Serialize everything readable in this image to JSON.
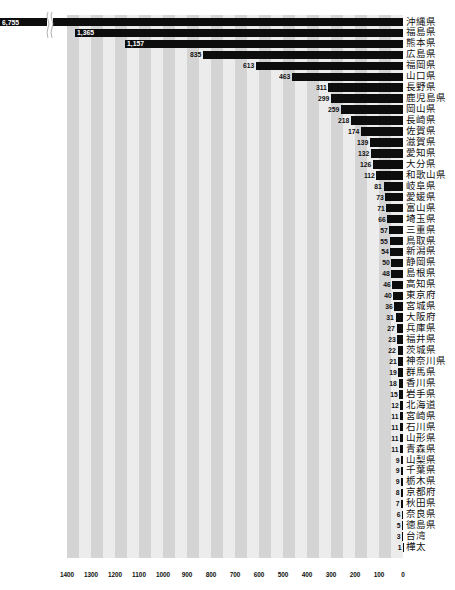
{
  "chart_data": {
    "type": "bar",
    "orientation": "horizontal",
    "direction": "right-to-left",
    "title": "",
    "xlabel": "",
    "ylabel": "",
    "xlim": [
      0,
      1400
    ],
    "axis_break_on_first_bar": true,
    "grid": "alternating vertical stripes every 50",
    "x_ticks": [
      "1400",
      "1300",
      "1200",
      "1100",
      "1000",
      "900",
      "800",
      "700",
      "600",
      "500",
      "400",
      "300",
      "200",
      "100",
      "0"
    ],
    "categories": [
      "沖縄県",
      "福島県",
      "熊本県",
      "広島県",
      "福岡県",
      "山口県",
      "長野県",
      "鹿児島県",
      "岡山県",
      "長崎県",
      "佐賀県",
      "滋賀県",
      "愛知県",
      "大分県",
      "和歌山県",
      "岐阜県",
      "愛媛県",
      "富山県",
      "埼玉県",
      "三重県",
      "鳥取県",
      "新潟県",
      "静岡県",
      "島根県",
      "高知県",
      "東京府",
      "宮城県",
      "大阪府",
      "兵庫県",
      "福井県",
      "茨城県",
      "神奈川県",
      "群馬県",
      "香川県",
      "岩手県",
      "北海道",
      "宮崎県",
      "石川県",
      "山形県",
      "青森県",
      "山梨県",
      "千葉県",
      "栃木県",
      "京都府",
      "秋田県",
      "奈良県",
      "徳島県",
      "台湾",
      "樺太"
    ],
    "values": [
      6755,
      1365,
      1157,
      835,
      613,
      463,
      311,
      299,
      259,
      218,
      174,
      139,
      132,
      126,
      112,
      81,
      73,
      71,
      66,
      57,
      55,
      54,
      50,
      48,
      46,
      40,
      36,
      31,
      27,
      23,
      22,
      21,
      19,
      18,
      15,
      12,
      11,
      11,
      11,
      11,
      9,
      9,
      9,
      8,
      7,
      6,
      5,
      3,
      1
    ],
    "value_labels": [
      "6,755",
      "1,365",
      "1,157",
      "835",
      "613",
      "463",
      "311",
      "299",
      "259",
      "218",
      "174",
      "139",
      "132",
      "126",
      "112",
      "81",
      "73",
      "71",
      "66",
      "57",
      "55",
      "54",
      "50",
      "48",
      "46",
      "40",
      "36",
      "31",
      "27",
      "23",
      "22",
      "21",
      "19",
      "18",
      "15",
      "12",
      "11",
      "11",
      "11",
      "11",
      "9",
      "9",
      "9",
      "8",
      "7",
      "6",
      "5",
      "3",
      "1"
    ]
  },
  "colors": {
    "bar": "#0d0d0d",
    "stripe_dark": "#d4d4d4",
    "stripe_light": "#ececec",
    "text": "#111111"
  }
}
